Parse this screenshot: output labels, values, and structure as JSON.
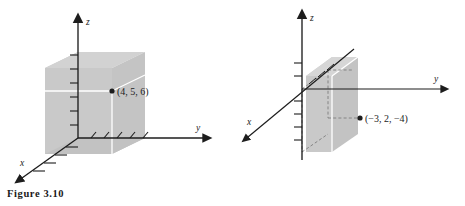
{
  "figure": {
    "caption": "Figure 3.10",
    "background_color": "#ffffff",
    "ink_color": "#1d1d1d",
    "box_fill_color": "#cccccc",
    "box_fill_color_dark": "#bfbfbf",
    "projection_line_color": "#ffffff",
    "dashed_line_color": "#8a8a8a"
  },
  "diagrams": [
    {
      "id": "left",
      "name": "octant-one-point-diagram",
      "axes": [
        {
          "name": "z",
          "label": "z",
          "direction": "up"
        },
        {
          "name": "y",
          "label": "y",
          "direction": "right"
        },
        {
          "name": "x",
          "label": "x",
          "direction": "down-left"
        }
      ],
      "point": {
        "label": "(4, 5, 6)",
        "coordinates": [
          4,
          5,
          6
        ],
        "marker": "filled-dot"
      },
      "solid": "rectangular-box",
      "tick_counts": {
        "z": 6,
        "x": 4,
        "y": 5
      }
    },
    {
      "id": "right",
      "name": "negative-octant-point-diagram",
      "axes": [
        {
          "name": "z",
          "label": "z",
          "direction": "up"
        },
        {
          "name": "y",
          "label": "y",
          "direction": "right"
        },
        {
          "name": "x",
          "label": "x",
          "direction": "down-left"
        }
      ],
      "point": {
        "label": "(−3, 2, −4)",
        "coordinates": [
          -3,
          2,
          -4
        ],
        "marker": "filled-dot"
      },
      "solid": "rectangular-box",
      "tick_counts": {
        "z": 4,
        "x": 3,
        "y": 2
      }
    }
  ]
}
